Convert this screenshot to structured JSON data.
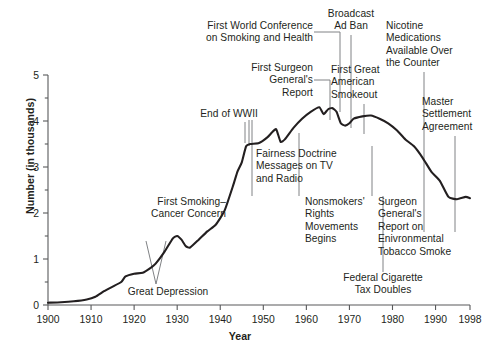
{
  "chart_data": {
    "type": "line",
    "title": "",
    "xlabel": "Year",
    "ylabel": "Number (in thousands)",
    "xlim": [
      1900,
      1998
    ],
    "ylim": [
      0,
      5
    ],
    "grid": false,
    "legend": "none",
    "line_color": "#231f20",
    "x_ticks": [
      "1900",
      "1910",
      "1920",
      "1930",
      "1940",
      "1950",
      "1960",
      "1970",
      "1980",
      "1990",
      "1998"
    ],
    "x_tick_values": [
      1900,
      1910,
      1920,
      1930,
      1940,
      1950,
      1960,
      1970,
      1980,
      1990,
      1998
    ],
    "y_ticks": [
      "0",
      "1",
      "2",
      "3",
      "4",
      "5"
    ],
    "y_tick_values": [
      0,
      1,
      2,
      3,
      4,
      5
    ],
    "y_minor_ticks": [
      0.5,
      1.5,
      2.5,
      3.5,
      4.5
    ],
    "series": [
      {
        "name": "Number (in thousands)",
        "x": [
          1900,
          1903,
          1906,
          1909,
          1911,
          1913,
          1915,
          1917,
          1918,
          1920,
          1922,
          1924,
          1925,
          1927,
          1929,
          1930,
          1931,
          1932,
          1933,
          1935,
          1937,
          1939,
          1941,
          1943,
          1944,
          1945,
          1946,
          1947,
          1949,
          1951,
          1952,
          1953,
          1954,
          1955,
          1957,
          1959,
          1961,
          1963,
          1964,
          1965,
          1966,
          1967,
          1968,
          1969,
          1970,
          1971,
          1973,
          1975,
          1977,
          1979,
          1981,
          1983,
          1985,
          1987,
          1989,
          1991,
          1993,
          1995,
          1997,
          1998
        ],
        "values": [
          0.05,
          0.06,
          0.08,
          0.12,
          0.18,
          0.3,
          0.4,
          0.5,
          0.62,
          0.68,
          0.7,
          0.82,
          0.9,
          1.15,
          1.45,
          1.5,
          1.42,
          1.28,
          1.25,
          1.42,
          1.6,
          1.75,
          2.05,
          2.6,
          2.9,
          3.1,
          3.45,
          3.5,
          3.52,
          3.65,
          3.75,
          3.82,
          3.55,
          3.6,
          3.85,
          4.05,
          4.2,
          4.3,
          4.15,
          4.25,
          4.28,
          4.2,
          3.95,
          3.9,
          3.95,
          4.05,
          4.1,
          4.12,
          4.05,
          3.95,
          3.8,
          3.6,
          3.45,
          3.2,
          2.9,
          2.7,
          2.35,
          2.3,
          2.35,
          2.32
        ]
      }
    ],
    "annotations": [
      {
        "name": "first-world-conference",
        "text": "First World Conference\non Smoking and Health",
        "align": "right",
        "year": 1967
      },
      {
        "name": "first-surgeon-generals-report",
        "text": "First Surgeon\nGeneral's\nReport",
        "align": "right",
        "year": 1964
      },
      {
        "name": "end-of-wwii",
        "text": "End of WWII",
        "align": "right",
        "year": 1945
      },
      {
        "name": "broadcast-ad-ban",
        "text": "Broadcast\nAd Ban",
        "align": "center",
        "year": 1971
      },
      {
        "name": "nicotine-medications",
        "text": "Nicotine\nMedications\nAvailable Over\nthe Counter",
        "align": "left",
        "year": 1996
      },
      {
        "name": "first-great-american-smokeout",
        "text": "First Great\nAmerican\nSmokeout",
        "align": "left",
        "year": 1977
      },
      {
        "name": "master-settlement-agreement",
        "text": "Master\nSettlement\nAgreement",
        "align": "left",
        "year": 1998
      },
      {
        "name": "fairness-doctrine",
        "text": "Fairness Doctrine\nMessages on TV\nand Radio",
        "align": "left",
        "year": 1968
      },
      {
        "name": "first-smoking-cancer-concern",
        "text": "First Smoking–\nCancer Concern",
        "align": "right",
        "year": 1953
      },
      {
        "name": "nonsmokers-rights",
        "text": "Nonsmokers'\nRights\nMovements\nBegins",
        "align": "left",
        "year": 1973
      },
      {
        "name": "surgeon-generals-report-ets",
        "text": "Surgeon\nGeneral's\nReport on\nEnivronmental\nTobacco Smoke",
        "align": "left",
        "year": 1986
      },
      {
        "name": "great-depression",
        "text": "Great Depression",
        "align": "center",
        "year": 1932
      },
      {
        "name": "federal-cigarette-tax-doubles",
        "text": "Federal Cigarette\nTax Doubles",
        "align": "center",
        "year": 1983
      }
    ]
  }
}
